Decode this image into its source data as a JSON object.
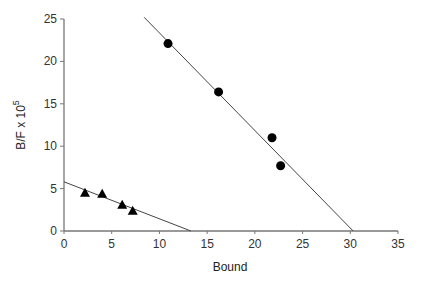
{
  "chart_data": {
    "type": "scatter",
    "title": "",
    "xlabel": "Bound",
    "ylabel": "B/F x 10",
    "ylabel_superscript": "5",
    "xlim": [
      0,
      35
    ],
    "ylim": [
      0,
      25
    ],
    "xticks": [
      0,
      5,
      10,
      15,
      20,
      25,
      30,
      35
    ],
    "yticks": [
      0,
      5,
      10,
      15,
      20,
      25
    ],
    "grid": false,
    "legend": null,
    "series": [
      {
        "name": "circles",
        "marker": "circle",
        "points": [
          [
            10.9,
            22.1
          ],
          [
            16.2,
            16.4
          ],
          [
            21.8,
            11.0
          ],
          [
            22.7,
            7.7
          ]
        ],
        "fit_line": [
          [
            8.4,
            25.2
          ],
          [
            30.3,
            0
          ]
        ]
      },
      {
        "name": "triangles",
        "marker": "triangle",
        "points": [
          [
            2.2,
            4.5
          ],
          [
            4.0,
            4.4
          ],
          [
            6.1,
            3.1
          ],
          [
            7.2,
            2.4
          ]
        ],
        "fit_line": [
          [
            0,
            5.8
          ],
          [
            13.3,
            0
          ]
        ]
      }
    ]
  },
  "axis": {
    "x_label": "Bound",
    "y_label_main": "B/F x 10",
    "y_label_sup": "5"
  }
}
